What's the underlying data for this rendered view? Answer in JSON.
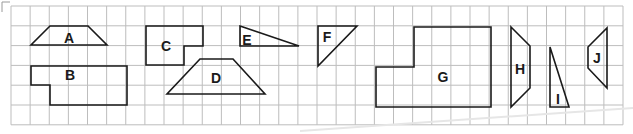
{
  "figure": {
    "grid": {
      "columns": 32,
      "rows": 6
    },
    "shapes": [
      {
        "id": "A",
        "label": "A",
        "kind": "trapezoid"
      },
      {
        "id": "B",
        "label": "B",
        "kind": "L-shaped hexagon"
      },
      {
        "id": "C",
        "label": "C",
        "kind": "L-shaped hexagon"
      },
      {
        "id": "D",
        "label": "D",
        "kind": "trapezoid"
      },
      {
        "id": "E",
        "label": "E",
        "kind": "right triangle"
      },
      {
        "id": "F",
        "label": "F",
        "kind": "right triangle"
      },
      {
        "id": "G",
        "label": "G",
        "kind": "L-shaped hexagon"
      },
      {
        "id": "H",
        "label": "H",
        "kind": "trapezoid"
      },
      {
        "id": "I",
        "label": "I",
        "kind": "right triangle"
      },
      {
        "id": "J",
        "label": "J",
        "kind": "trapezoid"
      }
    ]
  }
}
